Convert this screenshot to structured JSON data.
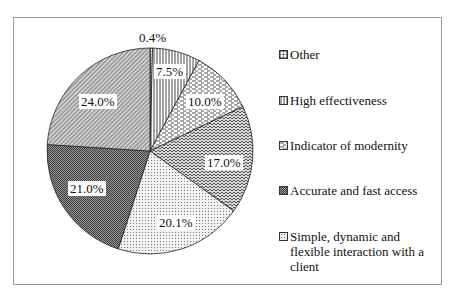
{
  "chart_data": {
    "type": "pie",
    "title": "",
    "categories": [
      "Other",
      "High effectiveness",
      "Indicator of modernity",
      "Accurate and fast access",
      "Simple, dynamic and flexible interaction with a client",
      "Unlabeled segment A",
      "Unlabeled segment B"
    ],
    "slices": [
      {
        "label": "0.4%",
        "value": 0.4,
        "pattern": "grid"
      },
      {
        "label": "7.5%",
        "value": 7.5,
        "pattern": "vertical-lines"
      },
      {
        "label": "10.0%",
        "value": 10.0,
        "pattern": "horizontal-dashes"
      },
      {
        "label": "17.0%",
        "value": 17.0,
        "pattern": "zigzag"
      },
      {
        "label": "20.1%",
        "value": 20.1,
        "pattern": "dots"
      },
      {
        "label": "21.0%",
        "value": 21.0,
        "pattern": "dense-checker-dark"
      },
      {
        "label": "24.0%",
        "value": 24.0,
        "pattern": "diagonal-lines"
      }
    ],
    "legend": {
      "position": "right",
      "entries": [
        "Other",
        "High effectiveness",
        "Indicator of modernity",
        "Accurate and fast access",
        "Simple, dynamic and flexible interaction with a client"
      ]
    }
  },
  "labels": {
    "s0": "0.4%",
    "s1": "7.5%",
    "s2": "10.0%",
    "s3": "17.0%",
    "s4": "20.1%",
    "s5": "21.0%",
    "s6": "24.0%"
  },
  "legend": {
    "items": [
      {
        "label": "Other"
      },
      {
        "label": "High effectiveness"
      },
      {
        "label": "Indicator of modernity"
      },
      {
        "label": "Accurate and fast access"
      },
      {
        "label": "Simple, dynamic and flexible interaction with a client"
      }
    ]
  }
}
